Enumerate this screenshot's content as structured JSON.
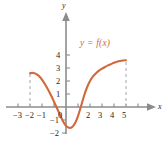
{
  "figure": {
    "width": 166,
    "height": 146,
    "background": "#ffffff",
    "curve_color": "#d2693c",
    "axis_color": "#8c8c8c",
    "dash_color": "#b0b0b0",
    "text_color": "#231f20"
  },
  "axes": {
    "x_name": "x",
    "y_name": "y",
    "x_ticks": [
      {
        "value": -3,
        "label": "−3"
      },
      {
        "value": -2,
        "label": "−2"
      },
      {
        "value": -1,
        "label": "−1"
      },
      {
        "value": 0,
        "label": "0"
      },
      {
        "value": 2,
        "label": "2"
      },
      {
        "value": 3,
        "label": "3"
      },
      {
        "value": 4,
        "label": "4"
      },
      {
        "value": 5,
        "label": "5"
      }
    ],
    "y_ticks": [
      {
        "value": 4,
        "label": "4"
      },
      {
        "value": 3,
        "label": "3"
      },
      {
        "value": 2,
        "label": "2"
      },
      {
        "value": 1,
        "label": "1"
      },
      {
        "value": -1,
        "label": "−1"
      },
      {
        "value": -2,
        "label": "−2"
      }
    ]
  },
  "chart_data": {
    "type": "line",
    "title": "",
    "xlabel": "x",
    "ylabel": "y",
    "xlim": [
      -3.6,
      6.2
    ],
    "ylim": [
      -2.6,
      4.6
    ],
    "grid": false,
    "legend": "inside-upper-right",
    "series": [
      {
        "name": "y = f(x)",
        "color": "#d2693c",
        "domain": [
          -3,
          5
        ],
        "x": [
          -3.0,
          -2.75,
          -2.5,
          -2.25,
          -2.0,
          -1.75,
          -1.5,
          -1.25,
          -1.0,
          -0.75,
          -0.5,
          -0.25,
          0.0,
          0.25,
          0.5,
          0.75,
          1.0,
          1.25,
          1.5,
          1.75,
          2.0,
          2.25,
          2.5,
          2.75,
          3.0,
          3.25,
          3.5,
          3.75,
          4.0,
          4.25,
          4.5,
          4.75,
          5.0
        ],
        "y": [
          2.6,
          2.62,
          2.55,
          2.38,
          2.1,
          1.75,
          1.35,
          0.9,
          0.4,
          -0.1,
          -0.6,
          -1.1,
          -1.45,
          -1.6,
          -1.55,
          -1.25,
          -0.7,
          0.05,
          0.85,
          1.5,
          2.0,
          2.35,
          2.6,
          2.8,
          2.95,
          3.08,
          3.2,
          3.3,
          3.4,
          3.48,
          3.54,
          3.58,
          3.6
        ]
      }
    ],
    "annotations": [
      {
        "type": "curve-label",
        "text": "y = f(x)",
        "x": 2.1,
        "y": 3.5,
        "color": "#d2693c"
      },
      {
        "type": "dashed-vertical",
        "x": -3,
        "y_from": 0,
        "y_to": 2.6,
        "color": "#b0b0b0"
      },
      {
        "type": "dashed-vertical",
        "x": 5,
        "y_from": 0,
        "y_to": 3.6,
        "color": "#b0b0b0"
      }
    ],
    "key_points": {
      "left_endpoint": [
        -3,
        2.6
      ],
      "right_endpoint": [
        5,
        3.6
      ],
      "minimum": [
        -0.35,
        -1.6
      ],
      "x_intercepts": [
        -0.85,
        1.2
      ],
      "y_intercept": [
        0,
        -1.45
      ]
    }
  },
  "labels": {
    "curve": "y = f(x)"
  }
}
